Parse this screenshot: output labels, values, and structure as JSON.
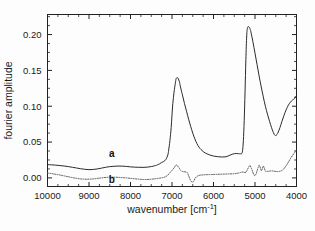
{
  "chart_data": {
    "type": "line",
    "title": "",
    "xlabel": "wavenumber [cm-1]",
    "xlabel_base": "wavenumber [cm",
    "xlabel_sup": "-1",
    "xlabel_tail": "]",
    "ylabel": "fourier amplitude",
    "xlim": [
      10000,
      4000
    ],
    "ylim": [
      -0.012,
      0.228
    ],
    "x_reversed": true,
    "grid": false,
    "legend": "inline-curve-labels",
    "xticks": [
      10000,
      9000,
      8000,
      7000,
      6000,
      5000,
      4000
    ],
    "xticklabels": [
      "10000",
      "9000",
      "8000",
      "7000",
      "6000",
      "5000",
      "4000"
    ],
    "x_minor_interval": 250,
    "yticks": [
      0.0,
      0.05,
      0.1,
      0.15,
      0.2
    ],
    "yticklabels": [
      "0.00",
      "0.05",
      "0.10",
      "0.15",
      "0.20"
    ],
    "y_minor_interval": 0.0125,
    "series": [
      {
        "name": "a",
        "label": "a",
        "style": "solid",
        "color": "#2b2b2b",
        "label_x": 8450,
        "label_y": 0.0285,
        "x": [
          10000,
          9900,
          9800,
          9700,
          9600,
          9500,
          9400,
          9300,
          9200,
          9100,
          9000,
          8900,
          8800,
          8700,
          8600,
          8500,
          8400,
          8300,
          8200,
          8100,
          8000,
          7900,
          7800,
          7700,
          7600,
          7500,
          7400,
          7350,
          7300,
          7250,
          7200,
          7150,
          7100,
          7080,
          7050,
          7020,
          7000,
          6980,
          6950,
          6920,
          6900,
          6870,
          6850,
          6820,
          6800,
          6750,
          6700,
          6650,
          6600,
          6550,
          6500,
          6450,
          6400,
          6350,
          6300,
          6250,
          6200,
          6100,
          6000,
          5900,
          5800,
          5700,
          5650,
          5600,
          5550,
          5500,
          5450,
          5400,
          5350,
          5320,
          5300,
          5280,
          5260,
          5240,
          5220,
          5200,
          5180,
          5150,
          5120,
          5100,
          5050,
          5000,
          4950,
          4900,
          4850,
          4800,
          4750,
          4700,
          4650,
          4600,
          4570,
          4540,
          4520,
          4500,
          4470,
          4440,
          4400,
          4350,
          4300,
          4250,
          4200,
          4150,
          4100,
          4050,
          4000
        ],
        "y": [
          0.0185,
          0.0182,
          0.0178,
          0.0172,
          0.0166,
          0.0158,
          0.0148,
          0.0138,
          0.0128,
          0.012,
          0.0115,
          0.0118,
          0.0125,
          0.0136,
          0.0148,
          0.0157,
          0.0162,
          0.0165,
          0.0164,
          0.016,
          0.0154,
          0.015,
          0.0148,
          0.0147,
          0.015,
          0.0158,
          0.0172,
          0.0182,
          0.0196,
          0.0215,
          0.023,
          0.0255,
          0.032,
          0.039,
          0.052,
          0.07,
          0.088,
          0.104,
          0.12,
          0.132,
          0.1385,
          0.14,
          0.1385,
          0.134,
          0.128,
          0.116,
          0.104,
          0.093,
          0.082,
          0.072,
          0.0625,
          0.0545,
          0.048,
          0.043,
          0.0395,
          0.0368,
          0.0348,
          0.0322,
          0.0305,
          0.0296,
          0.0292,
          0.0295,
          0.0305,
          0.0318,
          0.033,
          0.0338,
          0.034,
          0.0338,
          0.0336,
          0.034,
          0.038,
          0.052,
          0.08,
          0.12,
          0.165,
          0.198,
          0.2095,
          0.211,
          0.208,
          0.204,
          0.19,
          0.174,
          0.158,
          0.142,
          0.127,
          0.113,
          0.1,
          0.089,
          0.079,
          0.07,
          0.065,
          0.0612,
          0.0595,
          0.0592,
          0.0605,
          0.064,
          0.07,
          0.079,
          0.0875,
          0.095,
          0.101,
          0.1055,
          0.1085,
          0.1105,
          0.115
        ]
      },
      {
        "name": "b",
        "label": "b",
        "style": "dotted",
        "color": "#555555",
        "label_x": 8450,
        "label_y": -0.0065,
        "x": [
          10000,
          9900,
          9800,
          9700,
          9600,
          9500,
          9400,
          9300,
          9200,
          9100,
          9000,
          8900,
          8800,
          8700,
          8600,
          8500,
          8400,
          8300,
          8200,
          8100,
          8000,
          7900,
          7800,
          7700,
          7600,
          7500,
          7400,
          7300,
          7200,
          7150,
          7100,
          7050,
          7000,
          6950,
          6920,
          6900,
          6870,
          6850,
          6820,
          6800,
          6750,
          6700,
          6650,
          6620,
          6600,
          6570,
          6550,
          6520,
          6500,
          6470,
          6450,
          6400,
          6350,
          6300,
          6250,
          6200,
          6100,
          6000,
          5900,
          5800,
          5700,
          5600,
          5500,
          5450,
          5400,
          5350,
          5320,
          5300,
          5270,
          5250,
          5220,
          5200,
          5170,
          5150,
          5120,
          5100,
          5070,
          5050,
          5020,
          5000,
          4970,
          4950,
          4920,
          4900,
          4870,
          4850,
          4820,
          4800,
          4770,
          4750,
          4720,
          4700,
          4650,
          4600,
          4550,
          4500,
          4450,
          4400,
          4350,
          4300,
          4250,
          4200,
          4150,
          4100,
          4050,
          4000
        ],
        "y": [
          0.0068,
          0.006,
          0.005,
          0.004,
          0.0028,
          0.0016,
          0.0004,
          -0.0006,
          -0.0014,
          -0.0018,
          -0.0018,
          -0.0014,
          -0.0008,
          0.0,
          0.0006,
          0.001,
          0.001,
          0.0008,
          0.0004,
          0.0,
          -0.0006,
          -0.0012,
          -0.0018,
          -0.0022,
          -0.0022,
          -0.0018,
          -0.0012,
          -0.0004,
          0.0006,
          0.0018,
          0.004,
          0.0072,
          0.0105,
          0.014,
          0.0168,
          0.018,
          0.0172,
          0.0155,
          0.0132,
          0.011,
          0.009,
          0.0085,
          0.0082,
          0.006,
          0.003,
          -0.001,
          -0.004,
          -0.0055,
          -0.0058,
          -0.004,
          -0.001,
          0.002,
          0.0034,
          0.004,
          0.0042,
          0.0044,
          0.0046,
          0.0048,
          0.005,
          0.0052,
          0.0054,
          0.0056,
          0.0058,
          0.0062,
          0.0068,
          0.0075,
          0.008,
          0.0082,
          0.008,
          0.0076,
          0.0078,
          0.0098,
          0.013,
          0.0155,
          0.0172,
          0.015,
          0.011,
          0.0075,
          0.004,
          0.0032,
          0.006,
          0.01,
          0.015,
          0.0178,
          0.014,
          0.0102,
          0.013,
          0.0165,
          0.013,
          0.0095,
          0.0088,
          0.009,
          0.0095,
          0.0098,
          0.0095,
          0.009,
          0.0088,
          0.0092,
          0.0105,
          0.013,
          0.017,
          0.0215,
          0.0265,
          0.031,
          0.035,
          0.0388
        ]
      }
    ]
  }
}
